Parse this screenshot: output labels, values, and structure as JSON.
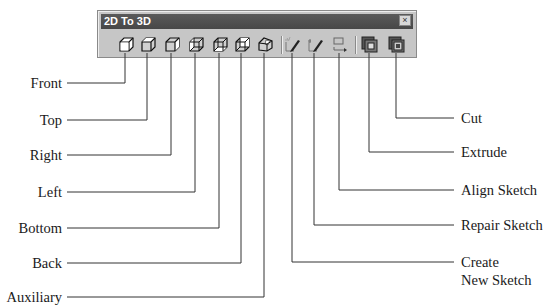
{
  "toolbar": {
    "title": "2D To 3D",
    "close_glyph": "×",
    "title_bar_color": "#4d4d4d",
    "background_color": "#c6c6c6"
  },
  "tools": [
    {
      "id": "front",
      "label": "Front",
      "icon": "cube-front-icon"
    },
    {
      "id": "top",
      "label": "Top",
      "icon": "cube-top-icon"
    },
    {
      "id": "right",
      "label": "Right",
      "icon": "cube-right-icon"
    },
    {
      "id": "left",
      "label": "Left",
      "icon": "cube-left-icon"
    },
    {
      "id": "bottom",
      "label": "Bottom",
      "icon": "cube-bottom-icon"
    },
    {
      "id": "back",
      "label": "Back",
      "icon": "cube-back-icon"
    },
    {
      "id": "auxiliary",
      "label": "Auxiliary",
      "icon": "cube-auxiliary-icon"
    },
    {
      "id": "create_new_sketch",
      "label_line1": "Create",
      "label_line2": "New Sketch",
      "icon": "create-sketch-pencil-icon"
    },
    {
      "id": "repair_sketch",
      "label": "Repair Sketch",
      "icon": "repair-sketch-pencil-icon"
    },
    {
      "id": "align_sketch",
      "label": "Align Sketch",
      "icon": "align-sketch-icon"
    },
    {
      "id": "extrude",
      "label": "Extrude",
      "icon": "extrude-icon"
    },
    {
      "id": "cut",
      "label": "Cut",
      "icon": "cut-icon"
    }
  ]
}
